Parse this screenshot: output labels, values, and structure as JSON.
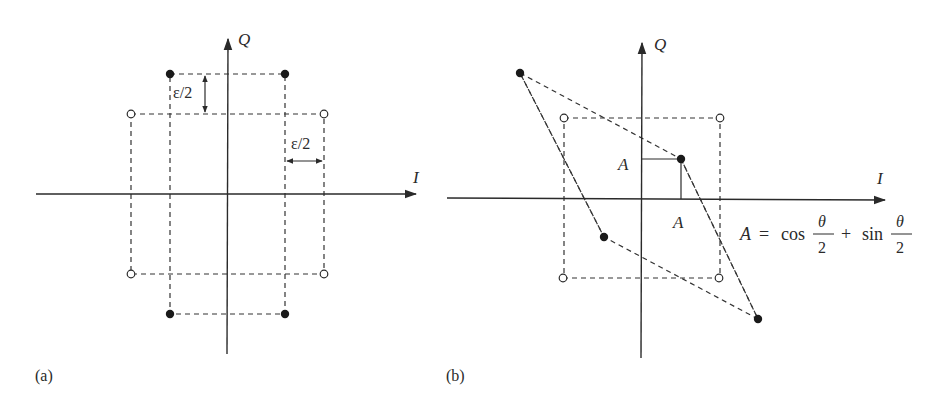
{
  "colors": {
    "ink": "#2a2a2a",
    "background": "#ffffff"
  },
  "panel_a": {
    "label": "(a)",
    "axis_q_label": "Q",
    "axis_i_label": "I",
    "eps_vertical_label": "ε/2",
    "eps_horizontal_label": "ε/2",
    "filled_points": [
      [
        170,
        74
      ],
      [
        285,
        74
      ],
      [
        170,
        314
      ],
      [
        285,
        314
      ]
    ],
    "open_points": [
      [
        131,
        114
      ],
      [
        324,
        114
      ],
      [
        131,
        274
      ],
      [
        324,
        274
      ]
    ]
  },
  "panel_b": {
    "label": "(b)",
    "axis_q_label": "Q",
    "axis_i_label": "I",
    "a_label_vertical": "A",
    "a_label_horizontal": "A",
    "formula": {
      "lhs": "A",
      "equals": "=",
      "cos": "cos",
      "plus": "+",
      "sin": "sin",
      "numerator": "θ",
      "denominator": "2"
    },
    "filled_points": [
      [
        520,
        73
      ],
      [
        681,
        159
      ],
      [
        604,
        237
      ],
      [
        758,
        319
      ]
    ],
    "open_points": [
      [
        564,
        118
      ],
      [
        720,
        118
      ],
      [
        563,
        278
      ],
      [
        719,
        278
      ]
    ]
  }
}
